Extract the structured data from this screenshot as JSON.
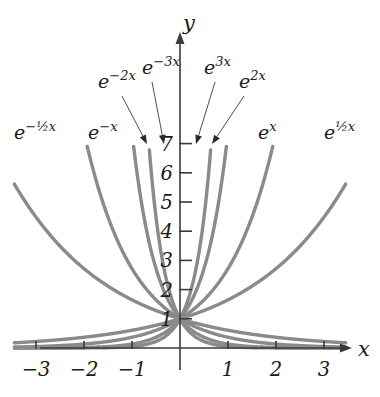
{
  "chart_data": {
    "type": "line",
    "title": "",
    "subtitle": "",
    "xlabel": "x",
    "ylabel": "y",
    "xlim": [
      -3.45,
      3.45
    ],
    "ylim": [
      -0.55,
      7.8
    ],
    "grid": false,
    "legend": "annotations-with-leader-arrows",
    "x_ticks": [
      -3,
      -2,
      -1,
      1,
      2,
      3
    ],
    "x_tick_labels": [
      "−3",
      "−2",
      "−1",
      "1",
      "2",
      "3"
    ],
    "y_ticks": [
      1,
      2,
      3,
      4,
      5,
      6,
      7
    ],
    "y_tick_labels": [
      "1",
      "2",
      "3",
      "4",
      "5",
      "6",
      "7"
    ],
    "common_point": [
      0,
      1
    ],
    "curve_color": "#8a8a8a",
    "axis_color": "#3a3a3a",
    "text_color": "#1a1a1a",
    "series": [
      {
        "name": "e^{3x}",
        "k": 3,
        "label": "e",
        "exponent": "3x",
        "label_x": 204,
        "label_y": 74,
        "arrow_from": [
          215,
          82
        ],
        "arrow_to": [
          196,
          144
        ]
      },
      {
        "name": "e^{2x}",
        "k": 2,
        "label": "e",
        "exponent": "2x",
        "label_x": 239,
        "label_y": 88,
        "arrow_from": [
          244,
          96
        ],
        "arrow_to": [
          212,
          144
        ]
      },
      {
        "name": "e^{x}",
        "k": 1,
        "label": "e",
        "exponent": "x",
        "label_x": 258,
        "label_y": 139,
        "arrow_from": null,
        "arrow_to": null
      },
      {
        "name": "e^{(1/2)x}",
        "k": 0.5,
        "label": "e",
        "exponent": "½x",
        "label_x": 324,
        "label_y": 139,
        "arrow_from": null,
        "arrow_to": null
      },
      {
        "name": "e^{-(1/2)x}",
        "k": -0.5,
        "label": "e",
        "exponent": "-½x",
        "label_x": 14,
        "label_y": 139,
        "arrow_from": null,
        "arrow_to": null
      },
      {
        "name": "e^{-x}",
        "k": -1,
        "label": "e",
        "exponent": "-x",
        "label_x": 88,
        "label_y": 139,
        "arrow_from": null,
        "arrow_to": null
      },
      {
        "name": "e^{-2x}",
        "k": -2,
        "label": "e",
        "exponent": "-2x",
        "label_x": 98,
        "label_y": 88,
        "arrow_from": [
          122,
          96
        ],
        "arrow_to": [
          147,
          144
        ]
      },
      {
        "name": "e^{-3x}",
        "k": -3,
        "label": "e",
        "exponent": "-3x",
        "label_x": 142,
        "label_y": 74,
        "arrow_from": [
          152,
          82
        ],
        "arrow_to": [
          164,
          144
        ]
      }
    ]
  },
  "axis": {
    "x_label": "x",
    "y_label": "y"
  },
  "labels": {
    "e_neg_half_x": "e",
    "e_neg_x": "e",
    "e_neg_2x": "e",
    "e_neg_3x": "e",
    "e_3x": "e",
    "e_2x": "e",
    "e_x": "e",
    "e_half_x": "e",
    "exp_neg_half_x": "−½x",
    "exp_neg_x": "−x",
    "exp_neg_2x": "−2x",
    "exp_neg_3x": "−3x",
    "exp_3x": "3x",
    "exp_2x": "2x",
    "exp_x": "x",
    "exp_half_x": "½x"
  },
  "ticks": {
    "x": [
      "−3",
      "−2",
      "−1",
      "1",
      "2",
      "3"
    ],
    "y": [
      "1",
      "2",
      "3",
      "4",
      "5",
      "6",
      "7"
    ]
  }
}
